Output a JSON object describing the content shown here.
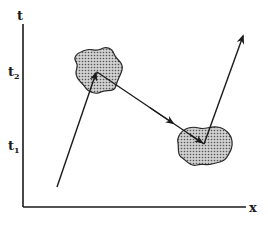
{
  "diagram": {
    "type": "spacetime-diagram",
    "axes": {
      "y_label": "t",
      "x_label": "x",
      "tick_labels": [
        {
          "base": "t",
          "sub": "2"
        },
        {
          "base": "t",
          "sub": "1"
        }
      ]
    },
    "events": [
      {
        "name": "region-at-t2",
        "fill": "#b5b5b5"
      },
      {
        "name": "region-at-t1",
        "fill": "#b5b5b5"
      }
    ],
    "arrows": [
      {
        "name": "incoming-worldline",
        "from": "origin",
        "to": "region-at-t2"
      },
      {
        "name": "connecting-vector",
        "from": "region-at-t2",
        "to": "region-at-t1"
      },
      {
        "name": "outgoing-worldline",
        "from": "region-at-t1",
        "to": "future"
      }
    ],
    "colors": {
      "line": "#1a1a1a",
      "region_fill": "#b5b5b5",
      "region_stroke": "#2a2a2a",
      "background": "#ffffff"
    }
  }
}
